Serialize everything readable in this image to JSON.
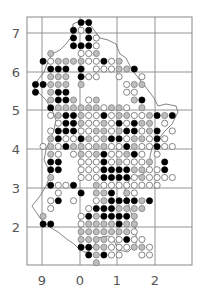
{
  "chart_data": {
    "type": "dot-distribution-map",
    "title": "",
    "legend": {
      "black": "filled circle (recent record)",
      "grey": "grey circle (older record)",
      "open": "open circle (old record)"
    },
    "grid": {
      "x_labels": [
        "9",
        "0",
        "1",
        "2"
      ],
      "y_labels": [
        "7",
        "6",
        "5",
        "4",
        "3",
        "2"
      ],
      "frame": {
        "left": 27,
        "top": 17,
        "right": 192,
        "bottom": 265
      },
      "x_lines": [
        42,
        80,
        117,
        155
      ],
      "y_lines": [
        33,
        72,
        110,
        149,
        188,
        227
      ]
    },
    "dots": {
      "origin_x": 35.5,
      "origin_y": 22.5,
      "step_x": 7.6,
      "step_y": 7.75,
      "radius": 3.1,
      "rows": [
        "......BB.............",
        ".....BOB.............",
        ".....B.BO............",
        ".....BBBO............",
        "..G...OOG............",
        ".BOGGGGOOBOG.........",
        "..BBB.B.OOOGGB.......",
        "..GGG.BOO..O..O......",
        "BBGGG.G.....OGG......",
        "B.GBB.......OO.......",
        "..GBBG.OG....GB......",
        "..BGGGGGGOGGO.G......",
        "..OGBBGOOBOGGOOGBGB..",
        "...OBBGOOGOBOBGG.O...",
        "..OBBBOOGGOGBBOGB.O..",
        "..GBOOBGOGBBOGGOBO...",
        ".OGOBGGOGGOOBGOOBOO..",
        "..GO.OGOGBOOGBO.O....",
        "..BB..OOOBOGOOOG.B...",
        "..BB..OOOBBBBGGOOB...",
        "..G...OOOBBBBOGOOOO..",
        "..BOOB..GOOOOOOOO....",
        "...O..B.GGB.GO.......",
        "..OB.O..OGBBBBGB.....",
        "..O....OBBBGGGG......",
        ".G....OBGBBBBG.......",
        ".BB...OGGGGBGG.......",
        "......GGGGGGGO.......",
        "......GGGGOOBOO......",
        "......BBGGOOOGGO.....",
        ".......BGBOO..OO.....",
        "........G............"
      ]
    }
  }
}
